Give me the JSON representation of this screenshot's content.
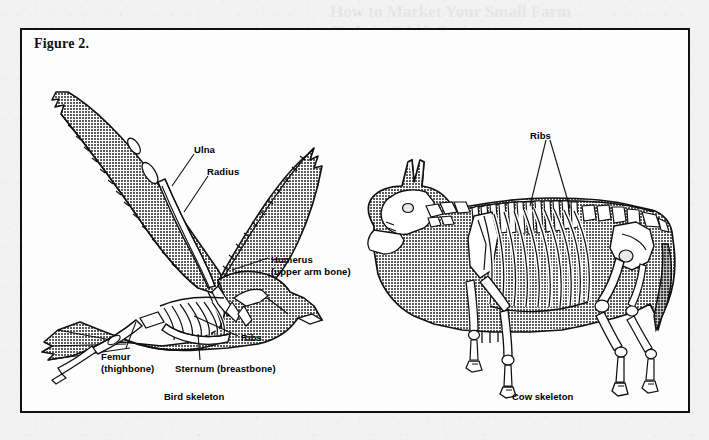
{
  "page": {
    "background_color": "#f2f2f2",
    "paper_color": "#fdfdfd",
    "ink_color": "#111111",
    "silhouette_fill": "#9a9a9a",
    "bone_fill": "#ffffff"
  },
  "figure": {
    "label": "Figure 2.",
    "border_color": "#111111"
  },
  "bird": {
    "caption": "Bird skeleton",
    "labels": [
      {
        "id": "ulna",
        "text": "Ulna",
        "x": 172,
        "y": 114
      },
      {
        "id": "radius",
        "text": "Radius",
        "x": 185,
        "y": 136
      },
      {
        "id": "humerus",
        "line1": "Humerus",
        "line2": "(upper arm bone)",
        "x": 249,
        "y": 224
      },
      {
        "id": "ribs",
        "text": "Ribs",
        "x": 219,
        "y": 302
      },
      {
        "id": "femur",
        "line1": "Femur",
        "line2": "(thighbone)",
        "x": 79,
        "y": 321
      },
      {
        "id": "sternum",
        "text": "Sternum (breastbone)",
        "x": 153,
        "y": 333
      }
    ],
    "caption_x": 142,
    "caption_y": 361
  },
  "cow": {
    "caption": "Cow skeleton",
    "labels": [
      {
        "id": "ribs",
        "text": "Ribs",
        "x": 508,
        "y": 100
      }
    ],
    "caption_x": 490,
    "caption_y": 361
  },
  "ghost_marks": [
    {
      "text": "How to Market Your Small Farm",
      "x": 330,
      "y": 2,
      "size": 17
    },
    {
      "text": "Producing Salable Goods",
      "x": 332,
      "y": 22,
      "size": 13
    }
  ]
}
